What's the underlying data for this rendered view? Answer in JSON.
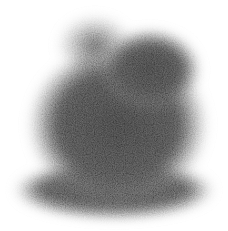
{
  "image": {
    "subject": "fuzzy grayscale bunny-shaped point-cloud blob",
    "background": "#ffffff",
    "colors": {
      "dark": "#6e6e6e",
      "mid": "#8c8c8c",
      "light": "#b4b4b4"
    }
  }
}
